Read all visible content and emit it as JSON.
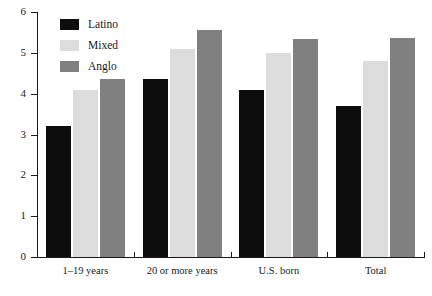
{
  "chart_data": {
    "type": "bar",
    "title": "",
    "subtitle": "",
    "xlabel": "",
    "ylabel": "",
    "categories": [
      "1–19 years",
      "20 or more years",
      "U.S. born",
      "Total"
    ],
    "series": [
      {
        "name": "Latino",
        "color": "#0d0d0d",
        "values": [
          3.2,
          4.35,
          4.1,
          3.7
        ]
      },
      {
        "name": "Mixed",
        "color": "#dcdcdc",
        "values": [
          4.1,
          5.1,
          5.0,
          4.8
        ]
      },
      {
        "name": "Anglo",
        "color": "#808080",
        "values": [
          4.35,
          5.55,
          5.35,
          5.37
        ]
      }
    ],
    "ylim": [
      0,
      6
    ],
    "yticks": [
      0,
      1,
      2,
      3,
      4,
      5,
      6
    ],
    "ytick_labels": [
      "0",
      "1",
      "2",
      "3",
      "4",
      "5",
      "6"
    ],
    "grid": false,
    "legend_position": "top-left",
    "legend_entries": [
      "Latino",
      "Mixed",
      "Anglo"
    ]
  },
  "axes": {
    "y_tick_labels": [
      "6",
      "5",
      "4",
      "3",
      "2",
      "1",
      "0"
    ],
    "x_tick_labels": [
      "1–19 years",
      "20 or more years",
      "U.S. born",
      "Total"
    ]
  },
  "legend": {
    "items": [
      {
        "label": "Latino",
        "swatch": "latino-swatch"
      },
      {
        "label": "Mixed",
        "swatch": "mixed-swatch"
      },
      {
        "label": "Anglo",
        "swatch": "anglo-swatch"
      }
    ]
  }
}
